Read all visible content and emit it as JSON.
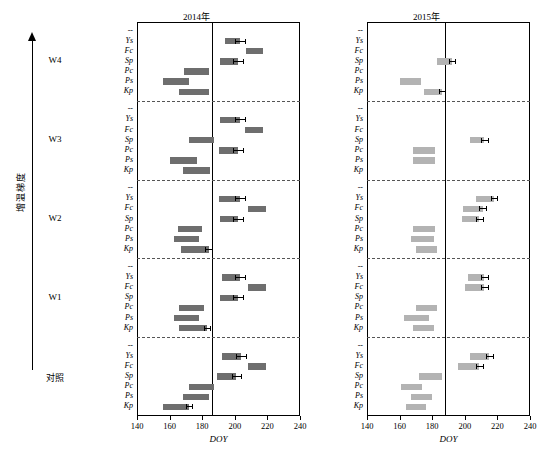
{
  "meta": {
    "ylabel": "增温梯度",
    "xlabel": "DOY",
    "panel_left_title": "2014年",
    "panel_right_title": "2015年"
  },
  "groups": [
    "W4",
    "W3",
    "W2",
    "W1",
    "对照"
  ],
  "species": [
    "Ys",
    "Fc",
    "Sp",
    "Pc",
    "Ps",
    "Kp"
  ],
  "species_with_blank": [
    "--",
    "Ys",
    "Fc",
    "Sp",
    "Pc",
    "Ps",
    "Kp"
  ],
  "xaxis": {
    "ticks": [
      140,
      160,
      180,
      200,
      220,
      240
    ],
    "min": 140,
    "max": 240
  },
  "colors": {
    "dark_bar": "#6e6e6e",
    "light_bar": "#b3b3b3",
    "axis": "#000000",
    "divider": "#555555"
  },
  "chart_data": {
    "type": "bar",
    "title": "",
    "subtitle": "",
    "xlabel": "DOY",
    "ylabel": "增温梯度",
    "xlim": [
      140,
      240
    ],
    "grid": false,
    "legend": null,
    "orientation": "horizontal-range-bars",
    "note": "Each bar spans the start and end DOY of a phenological stage; error bar shown at the right end.",
    "panels": [
      {
        "name": "2014年",
        "year": 2014,
        "color": "#6e6e6e",
        "reference_line": 186,
        "groups": [
          {
            "group": "W4",
            "bars": [
              {
                "species": "Ys",
                "start": 194,
                "end": 203,
                "err": 3
              },
              {
                "species": "Fc",
                "start": 207,
                "end": 217,
                "err": 0
              },
              {
                "species": "Sp",
                "start": 191,
                "end": 202,
                "err": 3
              },
              {
                "species": "Pc",
                "start": 169,
                "end": 184,
                "err": 0
              },
              {
                "species": "Ps",
                "start": 156,
                "end": 172,
                "err": 0
              },
              {
                "species": "Kp",
                "start": 166,
                "end": 184,
                "err": 0
              }
            ]
          },
          {
            "group": "W3",
            "bars": [
              {
                "species": "Ys",
                "start": 191,
                "end": 203,
                "err": 3
              },
              {
                "species": "Fc",
                "start": 206,
                "end": 217,
                "err": 0
              },
              {
                "species": "Sp",
                "start": 172,
                "end": 187,
                "err": 0
              },
              {
                "species": "Pc",
                "start": 190,
                "end": 202,
                "err": 3
              },
              {
                "species": "Ps",
                "start": 160,
                "end": 177,
                "err": 0
              },
              {
                "species": "Kp",
                "start": 168,
                "end": 185,
                "err": 0
              }
            ]
          },
          {
            "group": "W2",
            "bars": [
              {
                "species": "Ys",
                "start": 190,
                "end": 203,
                "err": 3
              },
              {
                "species": "Fc",
                "start": 208,
                "end": 219,
                "err": 0
              },
              {
                "species": "Sp",
                "start": 191,
                "end": 202,
                "err": 3
              },
              {
                "species": "Pc",
                "start": 165,
                "end": 180,
                "err": 0
              },
              {
                "species": "Ps",
                "start": 163,
                "end": 178,
                "err": 0
              },
              {
                "species": "Kp",
                "start": 167,
                "end": 184,
                "err": 2
              }
            ]
          },
          {
            "group": "W1",
            "bars": [
              {
                "species": "Ys",
                "start": 192,
                "end": 203,
                "err": 3
              },
              {
                "species": "Fc",
                "start": 208,
                "end": 219,
                "err": 0
              },
              {
                "species": "Sp",
                "start": 191,
                "end": 202,
                "err": 3
              },
              {
                "species": "Pc",
                "start": 166,
                "end": 181,
                "err": 0
              },
              {
                "species": "Ps",
                "start": 163,
                "end": 178,
                "err": 0
              },
              {
                "species": "Kp",
                "start": 166,
                "end": 183,
                "err": 2
              }
            ]
          },
          {
            "group": "对照",
            "bars": [
              {
                "species": "Ys",
                "start": 192,
                "end": 204,
                "err": 3
              },
              {
                "species": "Fc",
                "start": 208,
                "end": 219,
                "err": 0
              },
              {
                "species": "Sp",
                "start": 189,
                "end": 201,
                "err": 3
              },
              {
                "species": "Pc",
                "start": 172,
                "end": 187,
                "err": 0
              },
              {
                "species": "Ps",
                "start": 168,
                "end": 184,
                "err": 0
              },
              {
                "species": "Kp",
                "start": 156,
                "end": 172,
                "err": 2
              }
            ]
          }
        ]
      },
      {
        "name": "2015年",
        "year": 2015,
        "color": "#b3b3b3",
        "reference_line": 188,
        "groups": [
          {
            "group": "W4",
            "bars": [
              {
                "species": "Sp",
                "start": 183,
                "end": 192,
                "err": 2
              },
              {
                "species": "Ps",
                "start": 160,
                "end": 173,
                "err": 0
              },
              {
                "species": "Kp",
                "start": 175,
                "end": 186,
                "err": 2
              }
            ]
          },
          {
            "group": "W3",
            "bars": [
              {
                "species": "Sp",
                "start": 203,
                "end": 212,
                "err": 2
              },
              {
                "species": "Pc",
                "start": 168,
                "end": 182,
                "err": 0
              },
              {
                "species": "Ps",
                "start": 168,
                "end": 182,
                "err": 0
              }
            ]
          },
          {
            "group": "W2",
            "bars": [
              {
                "species": "Ys",
                "start": 207,
                "end": 218,
                "err": 2
              },
              {
                "species": "Fc",
                "start": 199,
                "end": 211,
                "err": 2
              },
              {
                "species": "Sp",
                "start": 198,
                "end": 209,
                "err": 2
              },
              {
                "species": "Pc",
                "start": 168,
                "end": 182,
                "err": 0
              },
              {
                "species": "Ps",
                "start": 167,
                "end": 181,
                "err": 0
              },
              {
                "species": "Kp",
                "start": 170,
                "end": 183,
                "err": 0
              }
            ]
          },
          {
            "group": "W1",
            "bars": [
              {
                "species": "Ys",
                "start": 202,
                "end": 212,
                "err": 2
              },
              {
                "species": "Fc",
                "start": 200,
                "end": 212,
                "err": 2
              },
              {
                "species": "Pc",
                "start": 170,
                "end": 183,
                "err": 0
              },
              {
                "species": "Ps",
                "start": 163,
                "end": 178,
                "err": 0
              },
              {
                "species": "Kp",
                "start": 168,
                "end": 181,
                "err": 0
              }
            ]
          },
          {
            "group": "对照",
            "bars": [
              {
                "species": "Ys",
                "start": 203,
                "end": 215,
                "err": 2
              },
              {
                "species": "Fc",
                "start": 196,
                "end": 209,
                "err": 2
              },
              {
                "species": "Sp",
                "start": 172,
                "end": 186,
                "err": 0
              },
              {
                "species": "Pc",
                "start": 161,
                "end": 174,
                "err": 0
              },
              {
                "species": "Ps",
                "start": 167,
                "end": 180,
                "err": 0
              },
              {
                "species": "Kp",
                "start": 164,
                "end": 176,
                "err": 0
              }
            ]
          }
        ]
      }
    ]
  }
}
